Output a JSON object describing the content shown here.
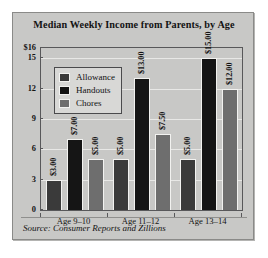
{
  "figure": {
    "background_color": "#c8c8c6",
    "border_color": "#8a8a88",
    "source_note": "Source: Consumer Reports and Zillions"
  },
  "chart_data": {
    "type": "bar",
    "title": "Median Weekly Income from Parents, by Age",
    "xlabel": "",
    "ylabel": "",
    "ylim": [
      0,
      16
    ],
    "yticks": [
      0,
      3,
      6,
      9,
      12,
      15,
      16
    ],
    "ytick_labels": [
      "0",
      "3",
      "6",
      "9",
      "12",
      "15",
      "$16"
    ],
    "grid": true,
    "legend_position": "upper left",
    "categories": [
      "Age 9–10",
      "Age 11–12",
      "Age 13–14"
    ],
    "series": [
      {
        "name": "Allowance",
        "color": "#3a3a3a",
        "values": [
          3.0,
          5.0,
          5.0
        ],
        "labels": [
          "$3.00",
          "$5.00",
          "$5.00"
        ]
      },
      {
        "name": "Handouts",
        "color": "#151515",
        "values": [
          7.0,
          13.0,
          15.0
        ],
        "labels": [
          "$7.00",
          "$13.00",
          "$15.00"
        ]
      },
      {
        "name": "Chores",
        "color": "#6e6e6e",
        "values": [
          5.0,
          7.5,
          12.0
        ],
        "labels": [
          "$5.00",
          "$7.50",
          "$12.00"
        ]
      }
    ]
  }
}
